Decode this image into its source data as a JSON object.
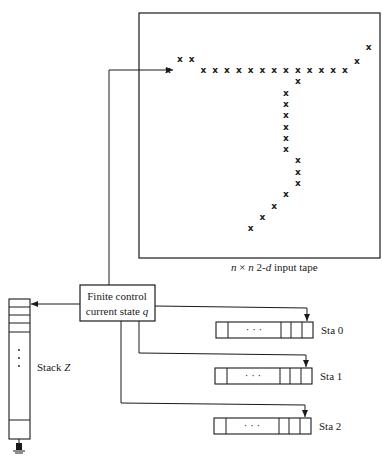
{
  "tape": {
    "caption_parts": [
      "n",
      " × ",
      "n",
      " 2-",
      "d",
      " input tape"
    ],
    "mark_symbol": "x",
    "marks": [
      {
        "col": 0,
        "row": 0
      },
      {
        "col": 1,
        "row": -1
      },
      {
        "col": 2,
        "row": -1
      },
      {
        "col": 3,
        "row": 0
      },
      {
        "col": 4,
        "row": 0
      },
      {
        "col": 5,
        "row": 0
      },
      {
        "col": 6,
        "row": 0
      },
      {
        "col": 7,
        "row": 0
      },
      {
        "col": 8,
        "row": 0
      },
      {
        "col": 9,
        "row": 0
      },
      {
        "col": 10,
        "row": 0
      },
      {
        "col": 11,
        "row": 0
      },
      {
        "col": 12,
        "row": 0
      },
      {
        "col": 13,
        "row": 0
      },
      {
        "col": 14,
        "row": 0
      },
      {
        "col": 15,
        "row": 0
      },
      {
        "col": 16,
        "row": -0.8
      },
      {
        "col": 17,
        "row": -2
      },
      {
        "col": 11,
        "row": 1
      },
      {
        "col": 10,
        "row": 2
      },
      {
        "col": 10,
        "row": 3
      },
      {
        "col": 10,
        "row": 4
      },
      {
        "col": 10,
        "row": 5
      },
      {
        "col": 10,
        "row": 6
      },
      {
        "col": 10,
        "row": 7
      },
      {
        "col": 11,
        "row": 8
      },
      {
        "col": 11,
        "row": 9
      },
      {
        "col": 11,
        "row": 10
      },
      {
        "col": 10,
        "row": 11
      },
      {
        "col": 9,
        "row": 12
      },
      {
        "col": 8,
        "row": 13
      },
      {
        "col": 7,
        "row": 14
      }
    ]
  },
  "finite_control": {
    "line1": "Finite control",
    "line2": "current state ",
    "state_var": "q"
  },
  "stack": {
    "label": "Stack ",
    "var": "Z",
    "dots": "⋮"
  },
  "storage_tapes": [
    {
      "label": "Sta 0",
      "dots": "· · ·"
    },
    {
      "label": "Sta 1",
      "dots": "· · ·"
    },
    {
      "label": "Sta 2",
      "dots": "· · ·"
    }
  ],
  "icons": {
    "ground": "ground-symbol-icon"
  }
}
